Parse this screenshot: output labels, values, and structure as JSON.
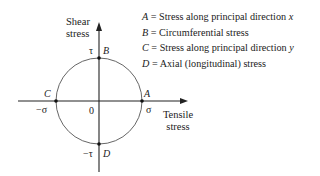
{
  "axes": {
    "y_label_line1": "Shear",
    "y_label_line2": "stress",
    "x_label_line1": "Tensile",
    "x_label_line2": "stress"
  },
  "points": {
    "A": {
      "letter": "A",
      "value": "σ"
    },
    "B": {
      "letter": "B",
      "value": "τ"
    },
    "C": {
      "letter": "C",
      "value": "−σ"
    },
    "D": {
      "letter": "D",
      "value": "−τ"
    },
    "origin": "0"
  },
  "legend": [
    {
      "key": "A",
      "text": " = Stress along principal direction ",
      "var": "x"
    },
    {
      "key": "B",
      "text": " = Circumferential stress",
      "var": ""
    },
    {
      "key": "C",
      "text": " = Stress along principal direction ",
      "var": "y"
    },
    {
      "key": "D",
      "text": " = Axial (longitudinal) stress",
      "var": ""
    }
  ]
}
